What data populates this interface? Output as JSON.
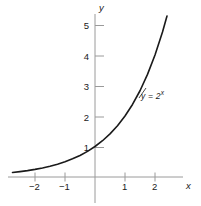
{
  "figure": {
    "title": "",
    "background_color": "#ffffff",
    "axis_color": "#999999",
    "curve_color": "#1a1a1a",
    "text_color": "#1a1a1a"
  },
  "axes": {
    "x_axis_name": "x",
    "y_axis_name": "y",
    "x_ticks": [
      "−2",
      "−1",
      "1",
      "2"
    ],
    "y_ticks": [
      "1",
      "2",
      "3",
      "4",
      "5"
    ]
  },
  "annotations": {
    "curve_label_lhs": "y = 2",
    "curve_label_exponent": "x"
  },
  "chart_data": {
    "type": "line",
    "title": "",
    "xlabel": "x",
    "ylabel": "y",
    "xlim": [
      -2.75,
      2.6
    ],
    "ylim": [
      -0.15,
      5.6
    ],
    "grid": false,
    "legend": "none",
    "xticks": [
      -2,
      -1,
      1,
      2
    ],
    "xticklabels": [
      "−2",
      "−1",
      "1",
      "2"
    ],
    "yticks": [
      1,
      2,
      3,
      4,
      5
    ],
    "yticklabels": [
      "1",
      "2",
      "3",
      "4",
      "5"
    ],
    "series": [
      {
        "name": "y = 2^x",
        "equation": "y = 2^x",
        "x": [
          -2.75,
          -2.5,
          -2.25,
          -2.0,
          -1.75,
          -1.5,
          -1.25,
          -1.0,
          -0.75,
          -0.5,
          -0.25,
          0.0,
          0.25,
          0.5,
          0.75,
          1.0,
          1.25,
          1.5,
          1.75,
          2.0,
          2.25,
          2.4
        ],
        "y": [
          0.149,
          0.177,
          0.21,
          0.25,
          0.297,
          0.354,
          0.42,
          0.5,
          0.595,
          0.707,
          0.841,
          1.0,
          1.189,
          1.414,
          1.682,
          2.0,
          2.378,
          2.828,
          3.364,
          4.0,
          4.757,
          5.278
        ]
      }
    ]
  }
}
